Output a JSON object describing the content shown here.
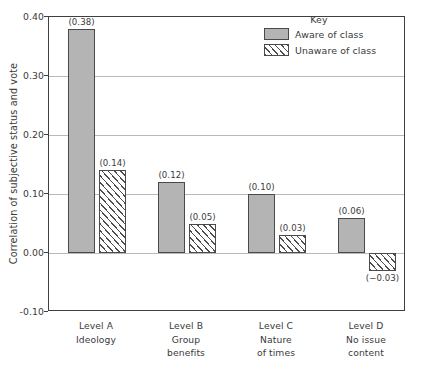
{
  "chart_data": {
    "type": "bar",
    "title": "",
    "xlabel": "",
    "ylabel": "Correlation of subjective status and vote",
    "ylim": [
      -0.1,
      0.4
    ],
    "ytick_labels": [
      "0.40",
      "0.30",
      "0.20",
      "0.10",
      "0.00",
      "-0.10"
    ],
    "ytick_values": [
      0.4,
      0.3,
      0.2,
      0.1,
      0.0,
      -0.1
    ],
    "grid": true,
    "legend_position": "top-right",
    "categories": [
      "Level A",
      "Level B",
      "Level C",
      "Level D"
    ],
    "category_sublabels": [
      [
        "Ideology"
      ],
      [
        "Group",
        "benefits"
      ],
      [
        "Nature",
        "of times"
      ],
      [
        "No issue",
        "content"
      ]
    ],
    "series": [
      {
        "name": "Aware of class",
        "style": "solid",
        "color": "#b4b4b4",
        "values": [
          0.38,
          0.12,
          0.1,
          0.06
        ],
        "data_labels": [
          "(0.38)",
          "(0.12)",
          "(0.10)",
          "(0.06)"
        ]
      },
      {
        "name": "Unaware of class",
        "style": "hatched",
        "color": "#ffffff",
        "values": [
          0.14,
          0.05,
          0.03,
          -0.03
        ],
        "data_labels": [
          "(0.14)",
          "(0.05)",
          "(0.03)",
          "(−0.03)"
        ]
      }
    ]
  },
  "legend": {
    "title": "Key",
    "entries": [
      {
        "label": "Aware of class",
        "swatch": "solid-gray-swatch"
      },
      {
        "label": "Unaware of class",
        "swatch": "hatched-swatch"
      }
    ]
  },
  "axes": {
    "y_title": "Correlation of subjective status and vote",
    "y_ticks": [
      "0.40",
      "0.30",
      "0.20",
      "0.10",
      "0.00",
      "-0.10"
    ]
  }
}
